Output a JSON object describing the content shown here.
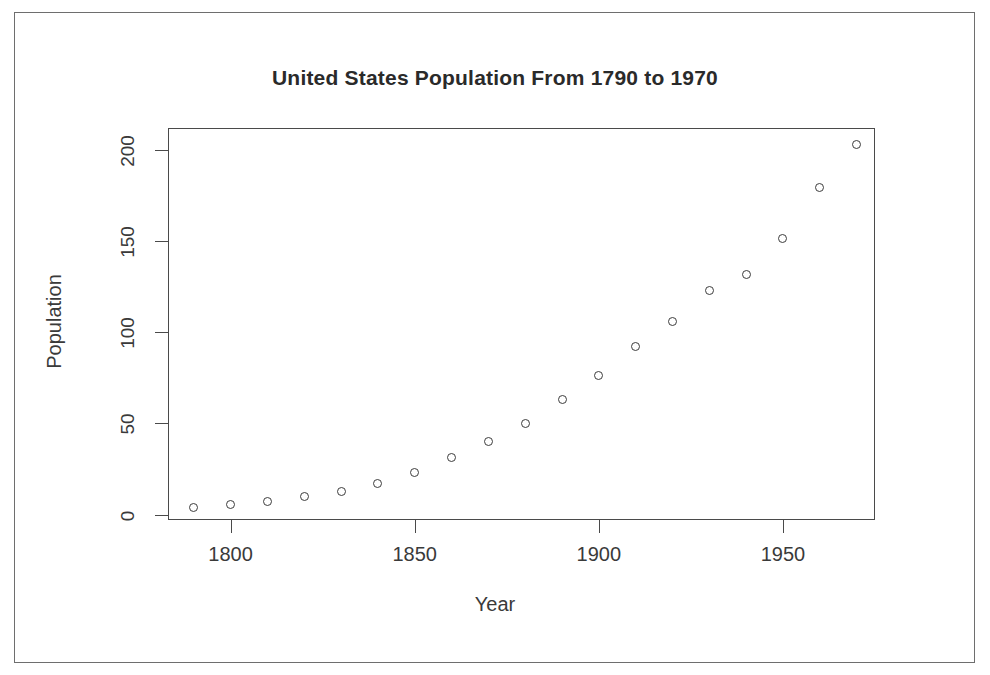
{
  "figure": {
    "title": "United States Population From 1790 to 1970",
    "x_axis_title": "Year",
    "y_axis_title": "Population",
    "frame_color": "#6e6e6e",
    "axis_color": "#4a4a4a",
    "point_color": "#3d3d3d",
    "background": "#ffffff"
  },
  "chart_data": {
    "type": "scatter",
    "title": "United States Population From 1790 to 1970",
    "xlabel": "Year",
    "ylabel": "Population",
    "xlim": [
      1783,
      1975
    ],
    "ylim": [
      -3,
      212
    ],
    "grid": false,
    "legend": "none",
    "marker": "open-circle",
    "x_ticks": [
      1800,
      1850,
      1900,
      1950
    ],
    "x_tick_labels": [
      "1800",
      "1850",
      "1900",
      "1950"
    ],
    "y_ticks": [
      0,
      50,
      100,
      150,
      200
    ],
    "y_tick_labels": [
      "0",
      "50",
      "100",
      "150",
      "200"
    ],
    "x": [
      1790,
      1800,
      1810,
      1820,
      1830,
      1840,
      1850,
      1860,
      1870,
      1880,
      1890,
      1900,
      1910,
      1920,
      1930,
      1940,
      1950,
      1960,
      1970
    ],
    "values": [
      3.93,
      5.31,
      7.24,
      9.64,
      12.9,
      17.1,
      23.2,
      31.4,
      39.8,
      50.2,
      62.9,
      76.0,
      92.0,
      105.7,
      122.8,
      131.7,
      151.3,
      179.3,
      203.2
    ],
    "series": [
      {
        "name": "Population",
        "values": [
          3.93,
          5.31,
          7.24,
          9.64,
          12.9,
          17.1,
          23.2,
          31.4,
          39.8,
          50.2,
          62.9,
          76.0,
          92.0,
          105.7,
          122.8,
          131.7,
          151.3,
          179.3,
          203.2
        ]
      }
    ]
  }
}
